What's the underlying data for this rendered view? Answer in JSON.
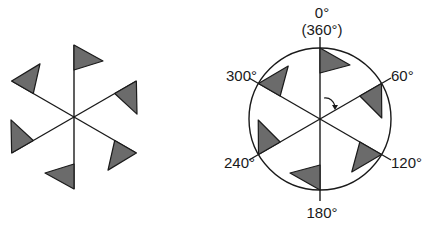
{
  "diagram": {
    "type": "rotational-symmetry",
    "colors": {
      "line": "#1a1a1a",
      "flag_fill": "#6b6b6b",
      "background": "#ffffff"
    },
    "left_figure": {
      "center": [
        74,
        117
      ],
      "arms": 6,
      "arm_angles_deg": [
        0,
        60,
        120,
        180,
        240,
        300
      ]
    },
    "right_figure": {
      "center": [
        320,
        119
      ],
      "circle_radius": 71,
      "arms": 6,
      "rotation_arrow": "clockwise",
      "labels": {
        "top": "0°",
        "top_alt": "(360°)",
        "a60": "60°",
        "a120": "120°",
        "a180": "180°",
        "a240": "240°",
        "a300": "300°"
      }
    }
  }
}
